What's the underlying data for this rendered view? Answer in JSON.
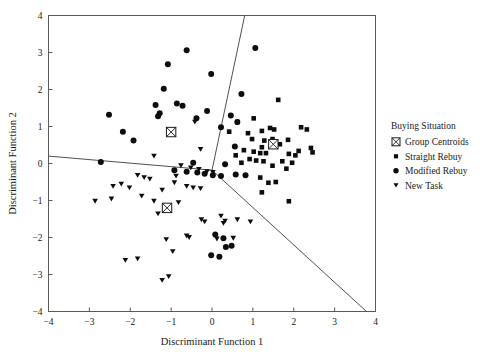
{
  "chart_data": {
    "type": "scatter",
    "title": "",
    "xlabel": "Discriminant Function 1",
    "ylabel": "Discriminant Function 2",
    "xlim": [
      -4,
      4
    ],
    "ylim": [
      -4,
      4
    ],
    "xticks": [
      "-4",
      "-3",
      "-2",
      "-1",
      "0",
      "1",
      "2",
      "3",
      "4"
    ],
    "yticks": [
      "-4",
      "-3",
      "-2",
      "-1",
      "0",
      "1",
      "2",
      "3",
      "4"
    ],
    "xtick_values": [
      -4,
      -3,
      -2,
      -1,
      0,
      1,
      2,
      3,
      4
    ],
    "ytick_values": [
      -4,
      -3,
      -2,
      -1,
      0,
      1,
      2,
      3,
      4
    ],
    "grid": false,
    "legend_position": "right",
    "legend_title": "Buying Situation",
    "series": [
      {
        "name": "Group Centroids",
        "marker": "crossed-square",
        "color": "#1a1a1a",
        "points": [
          [
            -1.0,
            0.85
          ],
          [
            1.5,
            0.52
          ],
          [
            -1.1,
            -1.2
          ]
        ]
      },
      {
        "name": "Straight Rebuy",
        "marker": "square",
        "color": "#0d0d0d",
        "points": [
          [
            0.62,
            1.12
          ],
          [
            1.02,
            1.22
          ],
          [
            1.62,
            1.72
          ],
          [
            0.42,
            0.86
          ],
          [
            0.88,
            0.82
          ],
          [
            2.18,
            0.98
          ],
          [
            2.32,
            0.92
          ],
          [
            1.22,
            0.88
          ],
          [
            1.42,
            0.96
          ],
          [
            1.52,
            0.92
          ],
          [
            0.98,
            0.66
          ],
          [
            1.28,
            0.62
          ],
          [
            1.48,
            0.66
          ],
          [
            1.86,
            0.64
          ],
          [
            1.22,
            0.44
          ],
          [
            1.66,
            0.52
          ],
          [
            0.78,
            0.36
          ],
          [
            1.02,
            0.32
          ],
          [
            1.18,
            0.28
          ],
          [
            1.32,
            0.28
          ],
          [
            1.88,
            0.26
          ],
          [
            2.04,
            0.22
          ],
          [
            2.12,
            0.34
          ],
          [
            0.92,
            0.12
          ],
          [
            1.08,
            0.08
          ],
          [
            1.26,
            0.06
          ],
          [
            1.72,
            0.06
          ],
          [
            1.96,
            0.02
          ],
          [
            1.48,
            -0.06
          ],
          [
            1.82,
            -0.14
          ],
          [
            1.18,
            -0.38
          ],
          [
            1.38,
            -0.52
          ],
          [
            1.56,
            -0.5
          ],
          [
            1.22,
            -0.78
          ],
          [
            1.88,
            -1.02
          ],
          [
            2.42,
            0.42
          ],
          [
            2.46,
            0.3
          ],
          [
            0.72,
            0.02
          ],
          [
            0.58,
            0.22
          ]
        ]
      },
      {
        "name": "Modified Rebuy",
        "marker": "circle",
        "color": "#0d0d0d",
        "points": [
          [
            -0.62,
            3.06
          ],
          [
            1.06,
            3.12
          ],
          [
            -1.08,
            2.68
          ],
          [
            -0.02,
            2.42
          ],
          [
            -1.18,
            2.02
          ],
          [
            0.72,
            1.88
          ],
          [
            -1.38,
            1.58
          ],
          [
            -0.86,
            1.62
          ],
          [
            -0.72,
            1.56
          ],
          [
            -2.52,
            1.32
          ],
          [
            -0.12,
            1.42
          ],
          [
            0.46,
            1.3
          ],
          [
            -2.18,
            0.86
          ],
          [
            -1.92,
            0.62
          ],
          [
            0.62,
            1.12
          ],
          [
            0.22,
            0.98
          ],
          [
            -0.38,
            1.22
          ],
          [
            0.56,
            0.46
          ],
          [
            -2.72,
            0.04
          ],
          [
            -0.46,
            0.02
          ],
          [
            0.32,
            -0.02
          ],
          [
            -0.18,
            -0.28
          ],
          [
            0.02,
            -0.32
          ],
          [
            0.22,
            -0.34
          ],
          [
            0.58,
            -0.3
          ],
          [
            0.82,
            -0.32
          ],
          [
            -1.28,
            1.36
          ],
          [
            -1.32,
            1.28
          ],
          [
            -0.92,
            -0.18
          ],
          [
            -0.62,
            -0.22
          ],
          [
            -0.36,
            -0.24
          ],
          [
            0.08,
            -1.92
          ],
          [
            0.28,
            -2.02
          ],
          [
            0.34,
            -2.26
          ],
          [
            0.48,
            -2.22
          ],
          [
            -0.02,
            -2.48
          ],
          [
            0.18,
            -2.52
          ]
        ]
      },
      {
        "name": "New Task",
        "marker": "triangle-down",
        "color": "#0d0d0d",
        "points": [
          [
            -0.42,
            1.12
          ],
          [
            -0.28,
            0.38
          ],
          [
            -1.42,
            0.2
          ],
          [
            -0.76,
            -0.06
          ],
          [
            -0.52,
            -0.12
          ],
          [
            -0.32,
            -0.16
          ],
          [
            -0.12,
            -0.22
          ],
          [
            0.02,
            -0.24
          ],
          [
            -1.82,
            -0.32
          ],
          [
            -1.66,
            -0.38
          ],
          [
            -1.52,
            -0.42
          ],
          [
            -2.42,
            -0.62
          ],
          [
            -2.22,
            -0.56
          ],
          [
            -2.02,
            -0.66
          ],
          [
            -0.62,
            -0.62
          ],
          [
            -0.46,
            -0.66
          ],
          [
            -0.28,
            -0.68
          ],
          [
            -1.22,
            -0.72
          ],
          [
            -1.72,
            -0.88
          ],
          [
            -2.86,
            -1.02
          ],
          [
            -2.46,
            -0.96
          ],
          [
            -1.42,
            -1.02
          ],
          [
            -0.82,
            -1.06
          ],
          [
            -1.32,
            -1.36
          ],
          [
            -0.26,
            -1.52
          ],
          [
            -0.18,
            -1.58
          ],
          [
            0.22,
            -1.42
          ],
          [
            0.32,
            -1.56
          ],
          [
            0.28,
            -1.62
          ],
          [
            -0.62,
            -1.96
          ],
          [
            -0.56,
            -2.0
          ],
          [
            -1.12,
            -2.06
          ],
          [
            0.12,
            -2.04
          ],
          [
            0.52,
            -2.02
          ],
          [
            -0.96,
            -2.38
          ],
          [
            -2.12,
            -2.62
          ],
          [
            -1.82,
            -2.58
          ],
          [
            -1.22,
            -3.16
          ],
          [
            -1.06,
            -3.06
          ],
          [
            0.62,
            -1.52
          ],
          [
            0.94,
            -1.58
          ],
          [
            -0.88,
            -0.34
          ],
          [
            -0.92,
            -0.52
          ]
        ]
      }
    ],
    "boundaries": [
      {
        "name": "left-boundary",
        "from": [
          -4,
          0.2
        ],
        "to": [
          0.0,
          -0.18
        ]
      },
      {
        "name": "upper-boundary",
        "from": [
          0.0,
          -0.18
        ],
        "to": [
          0.8,
          4
        ]
      },
      {
        "name": "lower-right-boundary",
        "from": [
          0.0,
          -0.18
        ],
        "to": [
          3.78,
          -4
        ]
      }
    ]
  },
  "legend": {
    "title": "Buying Situation",
    "entries": [
      {
        "label": "Group Centroids",
        "marker": "crossed-square"
      },
      {
        "label": "Straight Rebuy",
        "marker": "square"
      },
      {
        "label": "Modified Rebuy",
        "marker": "circle"
      },
      {
        "label": "New Task",
        "marker": "triangle-down"
      }
    ]
  }
}
